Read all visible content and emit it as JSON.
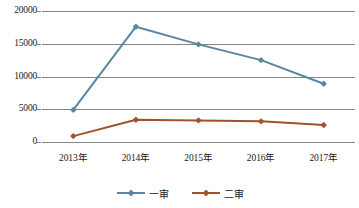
{
  "chart_data": {
    "type": "line",
    "title": "",
    "subtitle": "",
    "xlabel": "",
    "ylabel": "",
    "categories": [
      "2013年",
      "2014年",
      "2015年",
      "2016年",
      "2017年"
    ],
    "series": [
      {
        "name": "一审",
        "color": "#5B86A0",
        "marker": "diamond",
        "values": [
          4900,
          17600,
          14900,
          12500,
          8900
        ]
      },
      {
        "name": "二审",
        "color": "#A0522D",
        "marker": "diamond",
        "values": [
          900,
          3400,
          3300,
          3150,
          2600
        ]
      }
    ],
    "ylim": [
      0,
      20000
    ],
    "yticks": [
      0,
      5000,
      10000,
      15000,
      20000
    ],
    "ytick_labels": [
      "0",
      "5000",
      "10000",
      "15000",
      "20000"
    ],
    "grid": true,
    "grid_color": "#868686",
    "legend_position": "bottom",
    "legend": [
      "一审",
      "二审"
    ],
    "background": "#FFFFFF"
  }
}
